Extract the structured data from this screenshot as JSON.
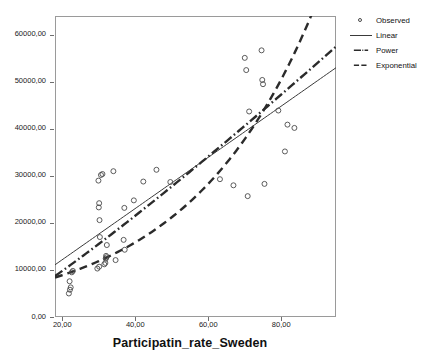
{
  "figure": {
    "background_color": "#ffffff",
    "frame_color": "#9a9a9a"
  },
  "axis": {
    "x_title": "Participatin_rate_Sweden",
    "y_title": ""
  },
  "legend": {
    "position": "top-right",
    "items": [
      {
        "label": "Observed",
        "key": "circle-marker-icon"
      },
      {
        "label": "Linear",
        "key": "solid-line-icon"
      },
      {
        "label": "Power",
        "key": "dash-dot-line-icon"
      },
      {
        "label": "Exponential",
        "key": "dashed-line-icon"
      }
    ]
  },
  "chart_data": {
    "type": "scatter",
    "title": "",
    "subtitle": "",
    "xlabel": "Participatin_rate_Sweden",
    "ylabel": "",
    "xlim": [
      18.0,
      95.0
    ],
    "ylim": [
      0,
      64000
    ],
    "grid": false,
    "legend_position": "top-right",
    "xticks": [
      20,
      40,
      60,
      80
    ],
    "xtick_labels": [
      "20,00",
      "40,00",
      "60,00",
      "80,00"
    ],
    "yticks": [
      0,
      10000,
      20000,
      30000,
      40000,
      50000,
      60000
    ],
    "ytick_labels": [
      "0,00",
      "10000,00",
      "20000,00",
      "30000,00",
      "40000,00",
      "50000,00",
      "60000,00"
    ],
    "marker": {
      "style": "open-circle",
      "edge_color": "#4a4a4a",
      "fill": "none",
      "size_px": 5
    },
    "series": [
      {
        "name": "Observed",
        "type": "scatter",
        "points": [
          [
            21.8,
            5000
          ],
          [
            22.1,
            5800
          ],
          [
            22.3,
            6300
          ],
          [
            22.0,
            7600
          ],
          [
            22.6,
            9500
          ],
          [
            22.9,
            9800
          ],
          [
            29.6,
            10300
          ],
          [
            30.1,
            10700
          ],
          [
            30.3,
            17000
          ],
          [
            30.2,
            20600
          ],
          [
            30.0,
            23300
          ],
          [
            30.1,
            24200
          ],
          [
            29.9,
            29000
          ],
          [
            30.6,
            30200
          ],
          [
            31.0,
            30400
          ],
          [
            31.5,
            11200
          ],
          [
            31.8,
            11500
          ],
          [
            31.9,
            12400
          ],
          [
            32.1,
            12700
          ],
          [
            32.0,
            13000
          ],
          [
            32.2,
            15300
          ],
          [
            34.0,
            31000
          ],
          [
            34.6,
            12100
          ],
          [
            36.8,
            16400
          ],
          [
            37.0,
            23200
          ],
          [
            37.1,
            14300
          ],
          [
            39.6,
            24800
          ],
          [
            42.2,
            28800
          ],
          [
            45.8,
            31300
          ],
          [
            49.6,
            28700
          ],
          [
            63.2,
            29300
          ],
          [
            66.9,
            28000
          ],
          [
            70.0,
            55100
          ],
          [
            70.4,
            52500
          ],
          [
            70.8,
            25700
          ],
          [
            71.2,
            43700
          ],
          [
            74.6,
            56700
          ],
          [
            74.8,
            50400
          ],
          [
            75.0,
            49500
          ],
          [
            75.4,
            28300
          ],
          [
            79.2,
            43900
          ],
          [
            81.0,
            35200
          ],
          [
            81.7,
            40900
          ],
          [
            83.6,
            40200
          ]
        ]
      },
      {
        "name": "Linear",
        "type": "line",
        "line_style": "solid",
        "line_width": 1,
        "color": "#3a3a3a",
        "equation_note": "straight fit line",
        "endpoints": [
          [
            18.0,
            11100
          ],
          [
            95.0,
            53000
          ]
        ]
      },
      {
        "name": "Power",
        "type": "curve",
        "line_style": "dash-dot",
        "line_width": 2.4,
        "color": "#2b2b2b",
        "endpoints": [
          [
            18.0,
            8700
          ],
          [
            95.0,
            57500
          ]
        ]
      },
      {
        "name": "Exponential",
        "type": "curve",
        "line_style": "dashed",
        "line_width": 2.4,
        "color": "#2b2b2b",
        "endpoints": [
          [
            18.0,
            8400
          ],
          [
            95.0,
            78000
          ]
        ]
      }
    ]
  }
}
